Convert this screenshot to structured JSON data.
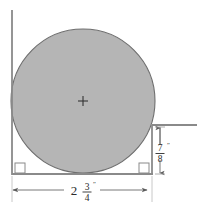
{
  "figure": {
    "type": "engineering-dimension-drawing",
    "background_color": "#ffffff"
  },
  "circle": {
    "name": "shaded-circle",
    "fill_color": "#b5b5b5",
    "stroke_color": "#6e6e6e",
    "center_x": 83,
    "center_y": 101,
    "radius": 72,
    "center_mark": "+"
  },
  "lines": {
    "stroke_color": "#8a8a8a",
    "left_wall": {
      "x": 12,
      "y_top": 10,
      "y_bottom": 175
    },
    "bottom_baseline": {
      "y": 174,
      "x_left": 12,
      "x_right": 153
    },
    "right_wall": {
      "x": 152,
      "y_top": 125,
      "y_bottom": 174
    },
    "top_right_ledge": {
      "y": 125,
      "x_left": 152,
      "x_right": 196
    }
  },
  "corner_markers": [
    {
      "name": "right-angle-marker-bottom-left",
      "x": 14,
      "y": 162
    },
    {
      "name": "right-angle-marker-bottom-right",
      "x": 138,
      "y": 162
    }
  ],
  "dimensions": {
    "vertical": {
      "name": "vertical-dimension-7-8-inch",
      "whole": "",
      "numerator": "7",
      "denominator": "8",
      "unit_mark": "″",
      "full_label": "7/8″",
      "line_x": 160,
      "y_top": 127,
      "y_bottom": 174,
      "label_x": 168,
      "label_y": 152
    },
    "horizontal": {
      "name": "horizontal-dimension-2-3-4-inch",
      "whole": "2",
      "numerator": "3",
      "denominator": "4",
      "unit_mark": "″",
      "full_label": "2 3/4″",
      "line_y": 190,
      "x_left": 13,
      "x_right": 147,
      "label_x": 80,
      "label_y": 192
    }
  },
  "extension_lines": {
    "left_ext": {
      "x": 12,
      "y_top": 176,
      "y_bottom": 200
    },
    "right_ext": {
      "x": 152,
      "y_top": 176,
      "y_bottom": 200
    },
    "stroke_color": "#bdbdbd"
  }
}
